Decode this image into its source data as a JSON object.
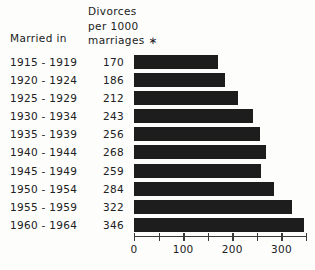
{
  "chart_data": {
    "type": "bar",
    "orientation": "horizontal",
    "title": "",
    "xlabel": "",
    "ylabel": "",
    "categories": [
      "1915 - 1919",
      "1920 - 1924",
      "1925 - 1929",
      "1930 - 1934",
      "1935 - 1939",
      "1940 - 1944",
      "1945 - 1949",
      "1950 - 1954",
      "1955 - 1959",
      "1960 - 1964"
    ],
    "values": [
      170,
      186,
      212,
      243,
      256,
      268,
      259,
      284,
      322,
      346
    ],
    "xlim": [
      0,
      350
    ],
    "xticks_major": [
      0,
      100,
      200,
      300
    ],
    "xtick_labels": [
      "0",
      "100",
      "200",
      "300"
    ],
    "xticks_minor": [
      50,
      150,
      250,
      350
    ],
    "grid": false,
    "legend": null,
    "bar_color": "#1d1d1d",
    "axis_color": "#3a3a3a"
  },
  "header": {
    "category_column_label": "Married in",
    "value_column_lines": [
      "Divorces",
      "per 1000",
      "marriages"
    ],
    "footnote_mark": "∗"
  }
}
